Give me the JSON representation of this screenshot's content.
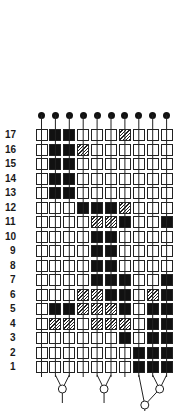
{
  "columns": [
    {
      "label": "EUTHERIAN MORPHOTYPE",
      "line1": "EUTHERIAN",
      "line2": "MORPHOTYPE"
    },
    {
      "label": "LAGOMORPHA"
    },
    {
      "label": "RODENTIA"
    },
    {
      "label": "SCANDENTIA"
    },
    {
      "label": "MICROCHIROPTERA"
    },
    {
      "label": "MEGACHIROPTERA"
    },
    {
      "label": "DERMOPTERA"
    },
    {
      "label": "STREPSIRHINI"
    },
    {
      "label": "TARSIIDAE"
    },
    {
      "label": "ANTHROPOIDEA"
    }
  ],
  "legend": {
    "open": "absent",
    "hatched": "polymorphic/uncertain",
    "black": "present"
  },
  "rows": [
    {
      "label": "17",
      "states": "obbooohooo"
    },
    {
      "label": "16",
      "states": "obbhoooooo"
    },
    {
      "label": "15",
      "states": "obbooooooo"
    },
    {
      "label": "14",
      "states": "obbooooooo"
    },
    {
      "label": "13",
      "states": "obbooooooo"
    },
    {
      "label": "12",
      "states": "ooobbbhooo"
    },
    {
      "label": "11",
      "states": "oooohhboob"
    },
    {
      "label": "10",
      "states": "oooobboooo"
    },
    {
      "label": "9",
      "states": "oooobboooo"
    },
    {
      "label": "8",
      "states": "oooobboooo"
    },
    {
      "label": "7",
      "states": "oooobbboob"
    },
    {
      "label": "6",
      "states": "ooohhbbohb"
    },
    {
      "label": "5",
      "states": "obbhhhbobb"
    },
    {
      "label": "4",
      "states": "ohhohhhobb"
    },
    {
      "label": "3",
      "states": "oooooobobb"
    },
    {
      "label": "2",
      "states": "ooooooobbb"
    },
    {
      "label": "1",
      "states": "ooooooobbb"
    }
  ],
  "tree": {
    "clades": [
      {
        "members": [
          "LAGOMORPHA",
          "RODENTIA"
        ]
      },
      {
        "members": [
          "MICROCHIROPTERA",
          "MEGACHIROPTERA"
        ]
      },
      {
        "members": [
          "STREPSIRHINI",
          [
            "TARSIIDAE",
            "ANTHROPOIDEA"
          ]
        ]
      }
    ]
  },
  "colors": {
    "ink": "#111111",
    "background": "#ffffff"
  }
}
